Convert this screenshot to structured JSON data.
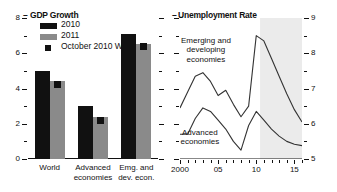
{
  "figure": {
    "panels": [
      {
        "id": "gdp",
        "title": "GDP Growth",
        "dash": "–"
      },
      {
        "id": "unemployment",
        "title": "Unemployment Rate",
        "dash": "–"
      }
    ]
  },
  "legend": {
    "items": [
      {
        "label": "2010",
        "type": "bar",
        "color": "#111111"
      },
      {
        "label": "2011",
        "type": "bar",
        "color": "#8a8a8a"
      },
      {
        "label": "October 2010 WEO",
        "type": "marker",
        "color": "#111111"
      }
    ]
  },
  "chart_data": [
    {
      "type": "bar",
      "title": "GDP Growth",
      "xlabel": "",
      "ylabel": "",
      "ylim": [
        0,
        8
      ],
      "yticks": [
        0,
        2,
        4,
        6,
        8
      ],
      "yticklabels": [
        "0",
        "2",
        "4",
        "6",
        "8"
      ],
      "yminor": [
        1,
        3,
        5,
        7
      ],
      "grid": false,
      "legend_position": "upper-left",
      "categories": [
        "World",
        "Advanced economies",
        "Emg. and dev. econ."
      ],
      "category_lines": [
        [
          "World"
        ],
        [
          "Advanced",
          "economies"
        ],
        [
          "Emg. and",
          "dev. econ."
        ]
      ],
      "series": [
        {
          "name": "2010",
          "color": "#111111",
          "values": [
            5.0,
            3.0,
            7.1
          ]
        },
        {
          "name": "2011",
          "color": "#8a8a8a",
          "values": [
            4.4,
            2.4,
            6.5
          ]
        },
        {
          "name": "October 2010 WEO",
          "color": "#111111",
          "marker": "square",
          "values": [
            4.2,
            2.2,
            6.4
          ]
        }
      ]
    },
    {
      "type": "line",
      "title": "Unemployment Rate",
      "xlabel": "",
      "ylabel": "",
      "ylim": [
        5,
        9
      ],
      "yticks": [
        5,
        6,
        7,
        8,
        9
      ],
      "yticklabels": [
        "5",
        "6",
        "7",
        "8",
        "9"
      ],
      "yminor": [
        5.5,
        6.5,
        7.5,
        8.5
      ],
      "xlim": [
        2000,
        2016
      ],
      "xticks": [
        2000,
        2005,
        2010,
        2015
      ],
      "xticklabels": [
        "2000",
        "05",
        "10",
        "15"
      ],
      "grid": false,
      "axis_side": "right",
      "forecast_shading": {
        "from": 2010.5,
        "to": 2016,
        "color": "#ebebeb"
      },
      "annotations": [
        {
          "text_lines": [
            "Emerging and",
            "developing",
            "economies"
          ],
          "x": 2003.4,
          "y": 8.35
        },
        {
          "text_lines": [
            "Advanced",
            "economies"
          ],
          "x": 2002.6,
          "y": 5.75
        }
      ],
      "x": [
        2000,
        2001,
        2002,
        2003,
        2004,
        2005,
        2006,
        2007,
        2008,
        2009,
        2010,
        2011,
        2012,
        2013,
        2014,
        2015,
        2016
      ],
      "series": [
        {
          "name": "Emerging and developing economies",
          "color": "#333333",
          "values": [
            6.45,
            6.9,
            7.35,
            7.45,
            7.2,
            6.8,
            6.95,
            6.55,
            6.2,
            6.5,
            8.5,
            8.35,
            7.85,
            7.35,
            6.85,
            6.4,
            6.05
          ]
        },
        {
          "name": "Advanced economies",
          "color": "#333333",
          "values": [
            5.7,
            5.7,
            6.15,
            6.45,
            6.35,
            6.1,
            5.85,
            5.5,
            5.25,
            5.95,
            6.35,
            6.1,
            5.85,
            5.65,
            5.5,
            5.42,
            5.38
          ]
        }
      ]
    }
  ]
}
